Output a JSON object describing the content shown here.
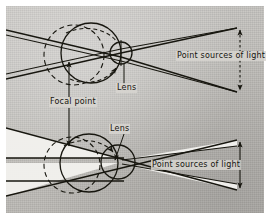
{
  "figure": {
    "background_color": "#c7c5c1",
    "ink_color": "#17160f",
    "paper_color": "#ffffff",
    "ray_fill_color": "#f2f1ee"
  },
  "panels": [
    {
      "id": "top",
      "name": "normal-eye-panel",
      "description": "Eye with lens focusing two point sources of light; dashed circle shows alternate eyeball position; focal point marked behind the lens.",
      "labels": {
        "lens": "Lens",
        "point_sources": "Point sources of light"
      }
    },
    {
      "id": "bottom",
      "name": "defective-eye-panel",
      "description": "Elongated eye with lens; rays from two point sources cross before the retina.",
      "labels": {
        "lens": "Lens",
        "point_sources": "Point sources of light"
      }
    }
  ],
  "shared_labels": {
    "focal_point": "Focal point"
  },
  "annotations": {
    "source_arrow_name": "point-sources-extent-arrow"
  }
}
